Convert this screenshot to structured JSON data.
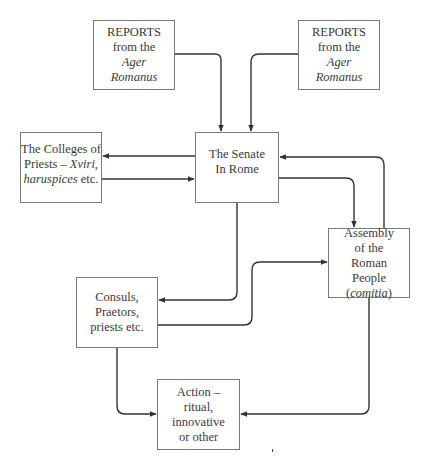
{
  "diagram": {
    "type": "flowchart",
    "stroke_color": "#333333",
    "border_color": "#7a7a7a",
    "nodes": {
      "reports_left": {
        "lines": [
          "REPORTS",
          "from the",
          "Ager",
          "Romanus"
        ]
      },
      "reports_right": {
        "lines": [
          "REPORTS",
          "from the",
          "Ager",
          "Romanus"
        ]
      },
      "senate": {
        "lines": [
          "The Senate",
          "In Rome"
        ]
      },
      "colleges": {
        "line1": "The Colleges of",
        "line2_plain": "Priests – ",
        "line2_italic": "Xviri,",
        "line3_italic": "haruspices",
        "line3_plain": " etc."
      },
      "assembly": {
        "lines": [
          "Assembly",
          "of the",
          "Roman",
          "People"
        ],
        "paren_open": "(",
        "paren_italic": "comitia",
        "paren_close": ")"
      },
      "consuls": {
        "lines": [
          "Consuls,",
          "Praetors,",
          "priests etc."
        ]
      },
      "action": {
        "lines": [
          "Action –",
          "ritual,",
          "innovative",
          "or other"
        ]
      }
    },
    "edges": [
      {
        "from": "reports_left",
        "to": "senate"
      },
      {
        "from": "reports_right",
        "to": "senate"
      },
      {
        "from": "senate",
        "to": "colleges"
      },
      {
        "from": "colleges",
        "to": "senate"
      },
      {
        "from": "senate",
        "to": "assembly"
      },
      {
        "from": "assembly",
        "to": "senate"
      },
      {
        "from": "senate",
        "to": "consuls"
      },
      {
        "from": "consuls",
        "to": "assembly"
      },
      {
        "from": "consuls",
        "to": "action"
      },
      {
        "from": "assembly",
        "to": "action"
      }
    ]
  }
}
